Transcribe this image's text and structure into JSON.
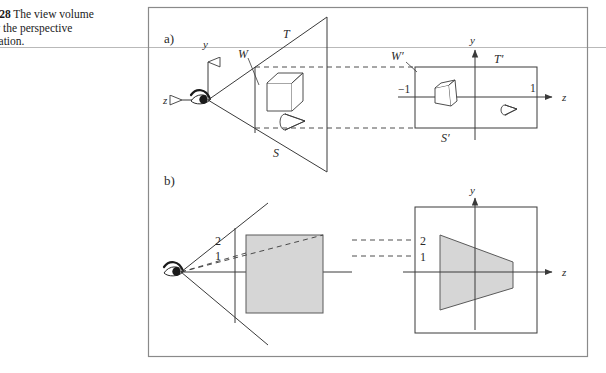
{
  "caption": {
    "figure_number": "E 7.28",
    "line1_rest": "  The view volume",
    "line2": "d by the perspective",
    "line3": "ormation."
  },
  "figure": {
    "panel_a_label": "a)",
    "panel_b_label": "b)",
    "panel_a": {
      "left": {
        "axis_y_label": "y",
        "axis_z_label": "z",
        "near_plane_label": "W",
        "top_plane_label": "T",
        "bottom_plane_label": "S",
        "objects": [
          "cube",
          "cone"
        ]
      },
      "right": {
        "axis_y_label": "y",
        "axis_z_label": "z",
        "near_plane_label": "W'",
        "top_plane_label": "T'",
        "bottom_plane_label": "S'",
        "tick_left_label": "-1",
        "tick_right_label": "1",
        "objects": [
          "distorted-cube",
          "distorted-cone"
        ]
      }
    },
    "panel_b": {
      "left": {
        "ray_label_far": "2",
        "ray_label_near": "1",
        "object": "square"
      },
      "right": {
        "axis_y_label": "y",
        "axis_z_label": "z",
        "ray_label_far": "2",
        "ray_label_near": "1",
        "object": "trapezoid"
      }
    },
    "colors": {
      "ink": "#3a3a3a",
      "shade_fill": "#d6d6d6",
      "shade_stroke": "#5a5a5a",
      "border": "#8a8a8a",
      "rule": "#b9b9b9"
    }
  }
}
